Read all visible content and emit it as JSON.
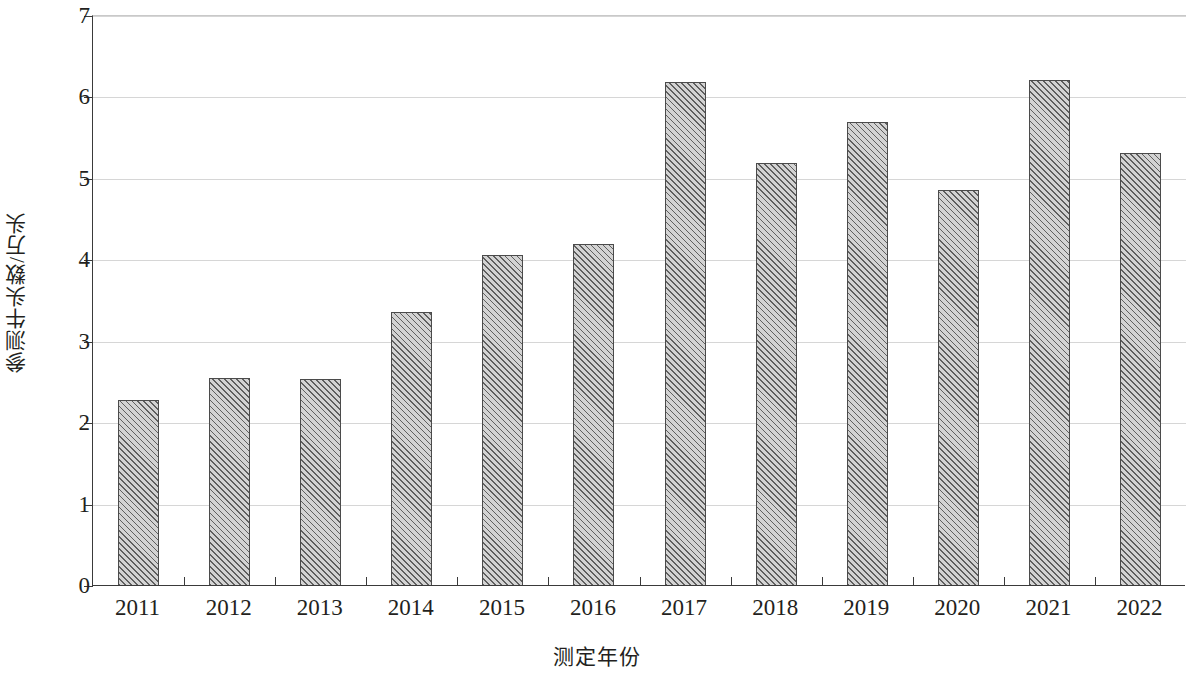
{
  "chart_data": {
    "type": "bar",
    "title": "",
    "xlabel": "测定年份",
    "ylabel": "参测牛头数/万头",
    "categories": [
      "2011",
      "2012",
      "2013",
      "2014",
      "2015",
      "2016",
      "2017",
      "2018",
      "2019",
      "2020",
      "2021",
      "2022"
    ],
    "values": [
      2.28,
      2.56,
      2.54,
      3.37,
      4.06,
      4.2,
      6.19,
      5.19,
      5.7,
      4.86,
      6.21,
      5.32
    ],
    "ylim": [
      0,
      7
    ],
    "ytick_labels": [
      "0",
      "1",
      "2",
      "3",
      "4",
      "5",
      "6",
      "7"
    ],
    "ytick_values": [
      0,
      1,
      2,
      3,
      4,
      5,
      6,
      7
    ],
    "grid": true,
    "grid_axis": "y",
    "legend": "none",
    "bar_fill_color": "#d3d3d3",
    "bar_hatch_color": "#5f5f5f",
    "bar_edge_color": "#4b4b4b",
    "axis_color": "#3a3a3a",
    "gridline_color": "#d6d6d6",
    "text_color": "#231f20"
  }
}
